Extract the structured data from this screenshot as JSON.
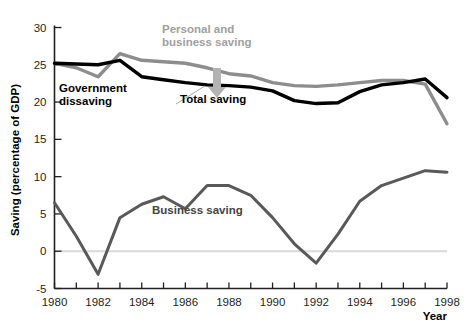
{
  "chart_data": {
    "type": "line",
    "title": "",
    "xlabel": "Year",
    "ylabel": "Saving (percentage of GDP)",
    "xlim": [
      1980,
      1998
    ],
    "ylim": [
      -5,
      30
    ],
    "ytick_labels": [
      "30",
      "25",
      "20",
      "15",
      "10",
      "5",
      "0",
      "-5"
    ],
    "ytick_values": [
      30,
      25,
      20,
      15,
      10,
      5,
      0,
      -5
    ],
    "xtick_labels": [
      "1980",
      "1982",
      "1984",
      "1986",
      "1988",
      "1990",
      "1992",
      "1994",
      "1996",
      "1998"
    ],
    "xtick_values": [
      1980,
      1982,
      1984,
      1986,
      1988,
      1990,
      1992,
      1994,
      1996,
      1998
    ],
    "x": [
      1980,
      1981,
      1982,
      1983,
      1984,
      1985,
      1986,
      1987,
      1988,
      1989,
      1990,
      1991,
      1992,
      1993,
      1994,
      1995,
      1996,
      1997,
      1998
    ],
    "grid": false,
    "zero_line": true,
    "legend_position": "inline-annotations",
    "series": [
      {
        "name": "Personal and business saving",
        "color": "#8d8d8d",
        "width": 3.4,
        "values": [
          25.2,
          24.6,
          23.4,
          26.5,
          25.6,
          25.4,
          25.2,
          24.6,
          23.8,
          23.5,
          22.6,
          22.2,
          22.1,
          22.3,
          22.6,
          22.9,
          22.9,
          22.4,
          17.1
        ]
      },
      {
        "name": "Total saving",
        "color": "#000000",
        "width": 3.4,
        "values": [
          25.2,
          25.1,
          25.0,
          25.6,
          23.4,
          23.0,
          22.6,
          22.3,
          22.2,
          22.0,
          21.5,
          20.2,
          19.8,
          19.9,
          21.4,
          22.3,
          22.6,
          23.1,
          20.6
        ]
      },
      {
        "name": "Business saving",
        "color": "#595959",
        "width": 3.0,
        "values": [
          6.5,
          2.0,
          -3.1,
          4.5,
          6.3,
          7.3,
          5.7,
          8.8,
          8.8,
          7.5,
          4.5,
          1.0,
          -1.6,
          2.3,
          6.7,
          8.8,
          9.8,
          10.8,
          10.6
        ]
      }
    ],
    "annotations": [
      {
        "id": "personal-and-business-saving",
        "text": "Personal and\nbusiness saving",
        "color": "#a0a0a0",
        "x": 162,
        "y": 33
      },
      {
        "id": "government-dissaving",
        "text": "Government\ndissaving",
        "color": "#000000",
        "x": 59,
        "y": 92
      },
      {
        "id": "total-saving",
        "text": "Total saving",
        "color": "#000000",
        "x": 180,
        "y": 103
      },
      {
        "id": "business-saving",
        "text": "Business saving",
        "color": "#444444",
        "x": 152,
        "y": 214
      }
    ]
  }
}
